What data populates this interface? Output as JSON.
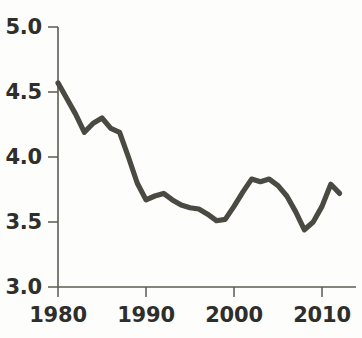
{
  "chart_data": {
    "type": "line",
    "title": "",
    "subtitle": "",
    "xlabel": "",
    "ylabel": "",
    "xlim": [
      1980,
      2012
    ],
    "ylim": [
      3.0,
      5.0
    ],
    "grid": false,
    "legend": null,
    "line_color": "#4a4a42",
    "axis_color": "#5b5b52",
    "background_color": "#fdfdfb",
    "x_ticks": [
      1980,
      1990,
      2000,
      2010
    ],
    "x_tick_labels": [
      "1980",
      "1990",
      "2000",
      "2010"
    ],
    "y_ticks": [
      3.0,
      3.5,
      4.0,
      4.5,
      5.0
    ],
    "y_tick_labels": [
      "3.0",
      "3.5",
      "4.0",
      "4.5",
      "5.0"
    ],
    "series": [
      {
        "name": "series-1",
        "x": [
          1980,
          1981,
          1982,
          1983,
          1984,
          1985,
          1986,
          1987,
          1988,
          1989,
          1990,
          1991,
          1992,
          1993,
          1994,
          1995,
          1996,
          1997,
          1998,
          1999,
          2000,
          2001,
          2002,
          2003,
          2004,
          2005,
          2006,
          2007,
          2008,
          2009,
          2010,
          2011,
          2012
        ],
        "values": [
          4.57,
          4.45,
          4.33,
          4.19,
          4.26,
          4.3,
          4.22,
          4.19,
          4.0,
          3.8,
          3.67,
          3.7,
          3.72,
          3.67,
          3.63,
          3.61,
          3.6,
          3.56,
          3.51,
          3.52,
          3.62,
          3.73,
          3.83,
          3.81,
          3.83,
          3.78,
          3.7,
          3.58,
          3.44,
          3.5,
          3.62,
          3.79,
          3.72
        ]
      }
    ]
  },
  "axes": {
    "y_axis_name": "y-axis",
    "x_axis_name": "x-axis"
  }
}
